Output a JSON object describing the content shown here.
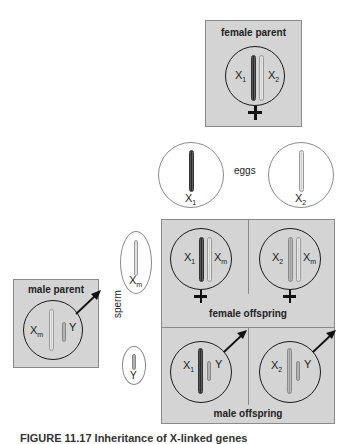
{
  "female_parent": {
    "title": "female parent",
    "chromosomes": [
      "X1",
      "X2"
    ],
    "symbol": "female-symbol"
  },
  "eggs": {
    "label": "eggs",
    "items": [
      {
        "name": "X",
        "sub": "1"
      },
      {
        "name": "X",
        "sub": "2"
      }
    ]
  },
  "male_parent": {
    "title": "male parent",
    "chromosomes": [
      "Xm",
      "Y"
    ],
    "symbol": "male-symbol"
  },
  "sperm": {
    "label": "sperm",
    "items": [
      {
        "name": "X",
        "sub": "m"
      },
      {
        "name": "Y",
        "sub": ""
      }
    ]
  },
  "female_offspring": {
    "label": "female offspring",
    "cells": [
      {
        "left": "X",
        "left_sub": "1",
        "right": "X",
        "right_sub": "m"
      },
      {
        "left": "X",
        "left_sub": "2",
        "right": "X",
        "right_sub": "m"
      }
    ]
  },
  "male_offspring": {
    "label": "male offspring",
    "cells": [
      {
        "left": "X",
        "left_sub": "1",
        "right": "Y"
      },
      {
        "left": "X",
        "left_sub": "2",
        "right": "Y"
      }
    ]
  },
  "caption": {
    "text": "FIGURE 11.17 Inheritance of X-linked genes"
  }
}
